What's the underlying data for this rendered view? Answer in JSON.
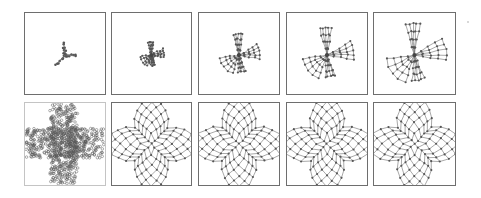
{
  "figure": {
    "colors": {
      "edge": "#6a6a6a",
      "node": "#555555",
      "border": "#6e6e6e",
      "border_light": "#c4c4c4",
      "background": "#ffffff"
    },
    "rows": [
      {
        "name": "top-row",
        "panels": [
          {
            "id": "top-1",
            "kind": "collapsed",
            "spread": 0.18,
            "x": 24,
            "y": 12,
            "w": 82,
            "h": 83
          },
          {
            "id": "top-2",
            "kind": "unfolding",
            "spread": 0.38,
            "x": 111,
            "y": 12,
            "w": 81,
            "h": 83
          },
          {
            "id": "top-3",
            "kind": "unfolding",
            "spread": 0.62,
            "x": 198,
            "y": 12,
            "w": 82,
            "h": 83
          },
          {
            "id": "top-4",
            "kind": "unfolding",
            "spread": 0.8,
            "x": 286,
            "y": 12,
            "w": 82,
            "h": 83
          },
          {
            "id": "top-5",
            "kind": "unfolding",
            "spread": 0.92,
            "x": 373,
            "y": 12,
            "w": 83,
            "h": 83
          }
        ]
      },
      {
        "name": "bottom-row",
        "panels": [
          {
            "id": "bottom-1",
            "kind": "dense-cross",
            "x": 24,
            "y": 102,
            "w": 82,
            "h": 84
          },
          {
            "id": "bottom-2",
            "kind": "lattice-cross",
            "x": 111,
            "y": 102,
            "w": 81,
            "h": 84
          },
          {
            "id": "bottom-3",
            "kind": "lattice-cross",
            "x": 198,
            "y": 102,
            "w": 82,
            "h": 84
          },
          {
            "id": "bottom-4",
            "kind": "lattice-cross",
            "x": 286,
            "y": 102,
            "w": 82,
            "h": 84
          },
          {
            "id": "bottom-5",
            "kind": "lattice-cross",
            "x": 373,
            "y": 102,
            "w": 83,
            "h": 84
          }
        ]
      }
    ]
  }
}
